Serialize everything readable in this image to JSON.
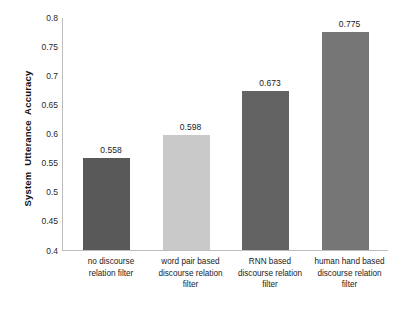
{
  "chart_data": {
    "type": "bar",
    "title": "",
    "subtitle": "",
    "xlabel": "",
    "ylabel": "System  Utterance  Accuracy",
    "ylim": [
      0.4,
      0.8
    ],
    "grid": false,
    "legend": false,
    "legend_position": "none",
    "categories": [
      "no discourse\nrelation filter",
      "word pair based\ndiscourse relation\nfilter",
      "RNN  based\ndiscourse relation\nfilter",
      "human hand based\ndiscourse relation\nfilter"
    ],
    "values": [
      0.558,
      0.598,
      0.673,
      0.775
    ],
    "value_labels": [
      "0.558",
      "0.598",
      "0.673",
      "0.775"
    ],
    "bar_colors": [
      "#595959",
      "#c9c9c9",
      "#636363",
      "#767676"
    ],
    "yticks": [
      0.8,
      0.75,
      0.7,
      0.65,
      0.6,
      0.55,
      0.5,
      0.45,
      0.4
    ],
    "ytick_labels": [
      "0.8",
      "0.75",
      "0.7",
      "0.65",
      "0.6",
      "0.55",
      "0.5",
      "0.45",
      "0.4"
    ],
    "axis_color": "#bdbdbd",
    "background": "#ffffff",
    "text_color": "#1a1a1a"
  }
}
